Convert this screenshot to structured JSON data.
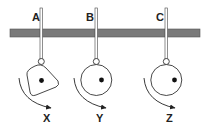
{
  "diagram": {
    "colors": {
      "bar": "#7a7a7a",
      "stroke": "#333333",
      "dot": "#111111",
      "background": "#ffffff"
    },
    "pivots": [
      {
        "label": "A",
        "x": 41
      },
      {
        "label": "B",
        "x": 96
      },
      {
        "label": "C",
        "x": 166
      }
    ],
    "objects": [
      {
        "label": "X",
        "shape": "irregular rounded quadrilateral",
        "center_of_mass": "near center",
        "rotation": "clockwise"
      },
      {
        "label": "Y",
        "shape": "circle",
        "center_of_mass": "slightly right of center",
        "rotation": "clockwise"
      },
      {
        "label": "Z",
        "shape": "circle",
        "center_of_mass": "far right of center",
        "rotation": "clockwise"
      }
    ]
  }
}
